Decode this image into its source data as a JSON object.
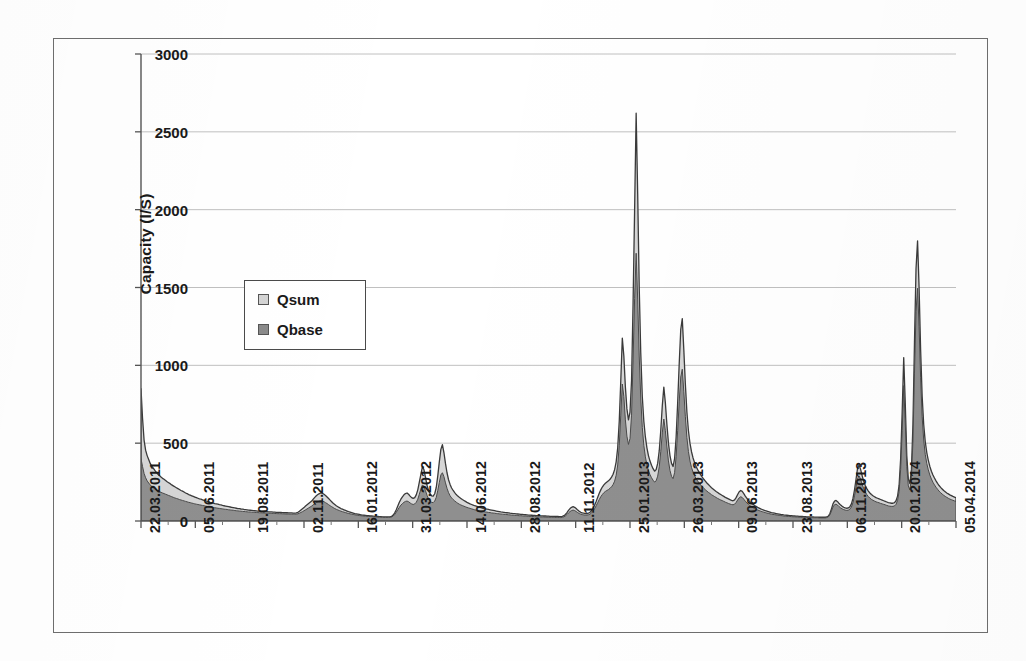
{
  "chart_data": {
    "type": "area",
    "title": "",
    "xlabel": "",
    "ylabel": "Capacity (l/S)",
    "ylim": [
      0,
      3000
    ],
    "y_ticks": [
      0,
      500,
      1000,
      1500,
      2000,
      2500,
      3000
    ],
    "y_tick_labels": [
      "0",
      "500",
      "1000",
      "1500",
      "2000",
      "2500",
      "3000"
    ],
    "grid": true,
    "legend_position": "upper-left-inside",
    "legend": [
      {
        "name": "Qsum",
        "color": "#d4d4d4",
        "swatch": "light-gray"
      },
      {
        "name": "Qbase",
        "color": "#8a8a8a",
        "swatch": "dark-gray"
      }
    ],
    "x_tick_labels": [
      "22.03.2011",
      "05.06.2011",
      "19.08.2011",
      "02.11.2011",
      "16.01.2012",
      "31.03.2012",
      "14.06.2012",
      "28.08.2012",
      "11.11.2012",
      "25.01.2013",
      "26.03.2013",
      "09.06.2013",
      "23.08.2013",
      "06.11.2013",
      "20.01.2014",
      "05.04.2014"
    ],
    "x_range_start": "22.03.2011",
    "x_range_end": "05.04.2014",
    "series": [
      {
        "name": "Qsum",
        "color": "#d4d4d4",
        "values": [
          850,
          660,
          520,
          455,
          420,
          395,
          370,
          352,
          340,
          325,
          312,
          300,
          292,
          282,
          274,
          268,
          260,
          252,
          246,
          240,
          232,
          226,
          220,
          214,
          208,
          202,
          196,
          192,
          186,
          180,
          176,
          170,
          166,
          162,
          158,
          154,
          150,
          146,
          142,
          140,
          136,
          132,
          130,
          126,
          124,
          120,
          118,
          115,
          112,
          110,
          108,
          105,
          103,
          100,
          98,
          96,
          94,
          92,
          90,
          88,
          86,
          84,
          82,
          80,
          79,
          77,
          76,
          74,
          73,
          72,
          70,
          69,
          68,
          67,
          66,
          65,
          64,
          63,
          62,
          62,
          61,
          60,
          60,
          59,
          58,
          58,
          57,
          57,
          56,
          56,
          55,
          55,
          54,
          54,
          53,
          53,
          52,
          52,
          52,
          51,
          51,
          52,
          56,
          62,
          70,
          78,
          86,
          96,
          104,
          112,
          120,
          128,
          140,
          152,
          162,
          170,
          176,
          180,
          178,
          172,
          164,
          154,
          144,
          134,
          124,
          114,
          106,
          98,
          92,
          86,
          80,
          76,
          72,
          68,
          64,
          60,
          57,
          54,
          51,
          48,
          46,
          44,
          42,
          40,
          38,
          37,
          36,
          35,
          34,
          33,
          32,
          31,
          30,
          30,
          29,
          28,
          28,
          27,
          27,
          26,
          26,
          26,
          27,
          30,
          38,
          52,
          72,
          96,
          120,
          140,
          155,
          168,
          176,
          180,
          172,
          160,
          150,
          145,
          150,
          168,
          200,
          250,
          300,
          348,
          330,
          280,
          230,
          196,
          175,
          162,
          160,
          175,
          215,
          290,
          380,
          460,
          490,
          440,
          370,
          310,
          265,
          235,
          212,
          196,
          182,
          170,
          160,
          152,
          145,
          138,
          132,
          126,
          120,
          115,
          110,
          106,
          102,
          98,
          95,
          92,
          89,
          86,
          83,
          80,
          78,
          76,
          74,
          72,
          70,
          68,
          66,
          64,
          62,
          60,
          58,
          57,
          56,
          54,
          53,
          52,
          50,
          49,
          48,
          47,
          46,
          45,
          44,
          43,
          42,
          41,
          40,
          39,
          38,
          38,
          37,
          36,
          36,
          35,
          34,
          34,
          33,
          33,
          32,
          32,
          31,
          31,
          30,
          30,
          30,
          29,
          29,
          29,
          28,
          28,
          30,
          34,
          42,
          54,
          68,
          80,
          88,
          92,
          88,
          80,
          70,
          62,
          56,
          52,
          50,
          48,
          48,
          50,
          56,
          66,
          82,
          102,
          126,
          152,
          178,
          200,
          218,
          232,
          242,
          250,
          258,
          268,
          282,
          300,
          330,
          380,
          470,
          640,
          900,
          1175,
          1060,
          860,
          720,
          650,
          700,
          900,
          1400,
          2000,
          2620,
          2100,
          1500,
          1080,
          800,
          640,
          540,
          470,
          420,
          385,
          358,
          336,
          320,
          330,
          370,
          450,
          580,
          740,
          860,
          760,
          620,
          500,
          420,
          370,
          350,
          400,
          540,
          760,
          1010,
          1230,
          1300,
          1100,
          880,
          700,
          580,
          500,
          445,
          405,
          375,
          350,
          330,
          312,
          296,
          282,
          268,
          256,
          244,
          234,
          224,
          214,
          206,
          198,
          190,
          183,
          176,
          170,
          164,
          158,
          152,
          147,
          142,
          137,
          133,
          130,
          136,
          150,
          170,
          188,
          196,
          190,
          176,
          160,
          146,
          134,
          124,
          115,
          107,
          100,
          94,
          88,
          83,
          78,
          74,
          70,
          66,
          63,
          60,
          57,
          54,
          52,
          50,
          48,
          46,
          44,
          42,
          41,
          39,
          38,
          37,
          36,
          35,
          34,
          33,
          32,
          31,
          31,
          30,
          29,
          29,
          28,
          28,
          27,
          27,
          26,
          26,
          26,
          25,
          25,
          25,
          24,
          24,
          24,
          24,
          24,
          26,
          32,
          48,
          78,
          110,
          128,
          132,
          124,
          112,
          102,
          94,
          88,
          84,
          82,
          84,
          92,
          110,
          145,
          200,
          270,
          340,
          360,
          330,
          290,
          255,
          228,
          208,
          192,
          180,
          170,
          162,
          156,
          150,
          146,
          142,
          138,
          134,
          130,
          126,
          122,
          118,
          116,
          114,
          114,
          118,
          130,
          160,
          230,
          400,
          700,
          1050,
          760,
          420,
          270,
          240,
          330,
          620,
          1150,
          1620,
          1800,
          1500,
          1100,
          800,
          620,
          510,
          440,
          390,
          350,
          320,
          296,
          276,
          258,
          242,
          228,
          216,
          206,
          196,
          188,
          180,
          174,
          168,
          163,
          158,
          154,
          150
        ]
      },
      {
        "name": "Qbase",
        "color": "#8a8a8a",
        "values": [
          400,
          350,
          305,
          278,
          258,
          244,
          232,
          222,
          214,
          206,
          200,
          194,
          189,
          184,
          180,
          176,
          172,
          168,
          164,
          160,
          156,
          152,
          148,
          145,
          142,
          138,
          135,
          132,
          129,
          126,
          123,
          120,
          118,
          115,
          113,
          110,
          108,
          106,
          104,
          102,
          100,
          98,
          96,
          94,
          92,
          90,
          89,
          87,
          85,
          84,
          82,
          81,
          79,
          78,
          76,
          75,
          74,
          72,
          71,
          70,
          69,
          67,
          66,
          65,
          64,
          63,
          62,
          61,
          60,
          59,
          58,
          58,
          57,
          56,
          55,
          55,
          54,
          53,
          53,
          52,
          52,
          51,
          51,
          50,
          50,
          49,
          49,
          48,
          48,
          47,
          47,
          47,
          46,
          46,
          45,
          45,
          45,
          44,
          44,
          44,
          44,
          44,
          46,
          50,
          55,
          60,
          66,
          72,
          78,
          84,
          90,
          96,
          104,
          112,
          118,
          124,
          128,
          130,
          128,
          124,
          118,
          112,
          105,
          98,
          92,
          86,
          80,
          75,
          71,
          67,
          63,
          60,
          57,
          54,
          51,
          48,
          46,
          44,
          42,
          40,
          38,
          37,
          35,
          34,
          33,
          32,
          31,
          30,
          29,
          29,
          28,
          27,
          26,
          26,
          25,
          25,
          24,
          24,
          23,
          23,
          23,
          23,
          24,
          26,
          32,
          42,
          56,
          72,
          88,
          102,
          112,
          120,
          126,
          128,
          124,
          116,
          110,
          106,
          110,
          120,
          140,
          172,
          205,
          232,
          222,
          195,
          165,
          142,
          128,
          120,
          118,
          128,
          152,
          196,
          248,
          296,
          310,
          285,
          245,
          210,
          182,
          162,
          148,
          138,
          129,
          121,
          114,
          108,
          103,
          99,
          95,
          91,
          87,
          84,
          81,
          78,
          75,
          72,
          70,
          68,
          66,
          64,
          62,
          60,
          58,
          57,
          55,
          54,
          52,
          51,
          50,
          48,
          47,
          46,
          45,
          44,
          43,
          42,
          41,
          40,
          39,
          38,
          37,
          36,
          36,
          35,
          34,
          34,
          33,
          32,
          32,
          31,
          30,
          30,
          29,
          29,
          28,
          28,
          27,
          27,
          26,
          26,
          26,
          25,
          25,
          25,
          24,
          24,
          24,
          23,
          23,
          23,
          23,
          22,
          24,
          27,
          33,
          42,
          52,
          61,
          67,
          70,
          67,
          61,
          54,
          48,
          44,
          41,
          39,
          38,
          38,
          40,
          44,
          52,
          64,
          80,
          98,
          118,
          138,
          156,
          170,
          182,
          190,
          196,
          202,
          210,
          220,
          234,
          256,
          294,
          360,
          485,
          680,
          880,
          800,
          650,
          545,
          492,
          530,
          680,
          1040,
          1430,
          1720,
          1420,
          1060,
          790,
          600,
          486,
          412,
          360,
          324,
          298,
          278,
          262,
          250,
          258,
          288,
          348,
          445,
          566,
          655,
          580,
          476,
          386,
          325,
          287,
          272,
          310,
          415,
          580,
          765,
          925,
          975,
          830,
          670,
          536,
          446,
          385,
          344,
          314,
          291,
          272,
          257,
          243,
          231,
          220,
          210,
          201,
          192,
          184,
          177,
          169,
          163,
          157,
          151,
          145,
          140,
          135,
          131,
          126,
          121,
          117,
          113,
          109,
          106,
          104,
          108,
          119,
          135,
          149,
          156,
          151,
          140,
          127,
          116,
          107,
          99,
          92,
          86,
          80,
          75,
          71,
          67,
          63,
          60,
          57,
          54,
          51,
          49,
          46,
          44,
          42,
          41,
          39,
          38,
          36,
          35,
          34,
          32,
          31,
          30,
          30,
          29,
          28,
          27,
          27,
          26,
          26,
          25,
          24,
          24,
          24,
          23,
          23,
          22,
          22,
          22,
          21,
          21,
          21,
          21,
          20,
          20,
          20,
          20,
          20,
          22,
          27,
          40,
          64,
          90,
          105,
          108,
          102,
          92,
          84,
          78,
          73,
          70,
          68,
          70,
          76,
          90,
          118,
          162,
          218,
          274,
          290,
          267,
          235,
          207,
          186,
          170,
          157,
          147,
          139,
          133,
          128,
          123,
          120,
          117,
          113,
          110,
          107,
          104,
          100,
          97,
          95,
          94,
          94,
          97,
          107,
          132,
          190,
          330,
          580,
          870,
          630,
          350,
          225,
          200,
          275,
          515,
          950,
          1345,
          1495,
          1250,
          920,
          670,
          520,
          428,
          370,
          328,
          295,
          270,
          249,
          232,
          217,
          204,
          192,
          182,
          173,
          165,
          158,
          152,
          146,
          141,
          137,
          133,
          129,
          126
        ]
      }
    ]
  },
  "legend": {
    "qsum_label": "Qsum",
    "qbase_label": "Qbase"
  },
  "axes": {
    "y_title": "Capacity (l/S)"
  }
}
